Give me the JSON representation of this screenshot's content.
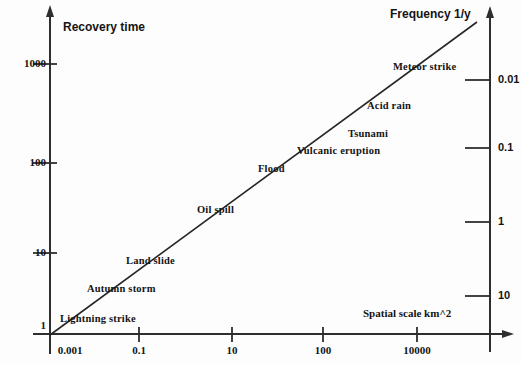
{
  "titles": {
    "y_left": "Recovery time",
    "y_right": "Frequency 1/y",
    "x": "Spatial scale km^2"
  },
  "chart_data": {
    "type": "scatter",
    "scales": "log-log conceptual sketch, straight trend line from lower-left origin to upper-right",
    "title": "",
    "xlabel": "Spatial scale km^2",
    "ylabel_left": "Recovery time",
    "ylabel_right": "Frequency 1/y",
    "grid": "off",
    "x_axis": {
      "label": "Spatial scale km^2",
      "ticks": [
        {
          "text": "0.001",
          "px_x": 50,
          "px_label_cx": 70,
          "draw_tick": false
        },
        {
          "text": "0.1",
          "px_x": 139,
          "draw_tick": true
        },
        {
          "text": "10",
          "px_x": 232,
          "draw_tick": true
        },
        {
          "text": "100",
          "px_x": 323,
          "draw_tick": true
        },
        {
          "text": "10000",
          "px_x": 417,
          "draw_tick": true
        }
      ]
    },
    "y_left_axis": {
      "label": "Recovery time",
      "ticks": [
        {
          "text": "1000",
          "px_y": 64,
          "draw_tick": true
        },
        {
          "text": "100",
          "px_y": 163,
          "draw_tick": true
        },
        {
          "text": "10",
          "px_y": 253,
          "draw_tick": true
        },
        {
          "text": "1",
          "px_y": 326,
          "draw_tick": false
        }
      ]
    },
    "y_right_axis": {
      "label": "Frequency 1/y",
      "ticks": [
        {
          "text": "0.01",
          "px_y": 80
        },
        {
          "text": "0.1",
          "px_y": 148
        },
        {
          "text": "1",
          "px_y": 222
        },
        {
          "text": "10",
          "px_y": 296
        }
      ]
    },
    "trend_line_px": [
      [
        50,
        335
      ],
      [
        477,
        22
      ]
    ],
    "events": [
      {
        "label": "Lightning strike",
        "px": [
          60,
          313
        ],
        "spatial_scale_km2": 0.003,
        "recovery_time_y": 1,
        "frequency_1_per_y": 20
      },
      {
        "label": "Autumn storm",
        "px": [
          87,
          283
        ],
        "spatial_scale_km2": 0.02,
        "recovery_time_y": 2.5,
        "frequency_1_per_y": 8
      },
      {
        "label": "Land slide",
        "px": [
          126,
          255
        ],
        "spatial_scale_km2": 0.2,
        "recovery_time_y": 8,
        "frequency_1_per_y": 2.5
      },
      {
        "label": "Oil spill",
        "px": [
          197,
          204
        ],
        "spatial_scale_km2": 5,
        "recovery_time_y": 30,
        "frequency_1_per_y": 0.8
      },
      {
        "label": "Flood",
        "px": [
          258,
          163
        ],
        "spatial_scale_km2": 40,
        "recovery_time_y": 90,
        "frequency_1_per_y": 0.25
      },
      {
        "label": "Vulcanic eruption",
        "px": [
          297,
          145
        ],
        "spatial_scale_km2": 80,
        "recovery_time_y": 130,
        "frequency_1_per_y": 0.15
      },
      {
        "label": "Tsunami",
        "px": [
          348,
          128
        ],
        "spatial_scale_km2": 200,
        "recovery_time_y": 200,
        "frequency_1_per_y": 0.08
      },
      {
        "label": "Acid rain",
        "px": [
          367,
          100
        ],
        "spatial_scale_km2": 500,
        "recovery_time_y": 400,
        "frequency_1_per_y": 0.03
      },
      {
        "label": "Meteor strike",
        "px": [
          393,
          61
        ],
        "spatial_scale_km2": 20000,
        "recovery_time_y": 900,
        "frequency_1_per_y": 0.01
      }
    ],
    "note": "Event numeric values are approximate, estimated from label positions along the trend line."
  }
}
